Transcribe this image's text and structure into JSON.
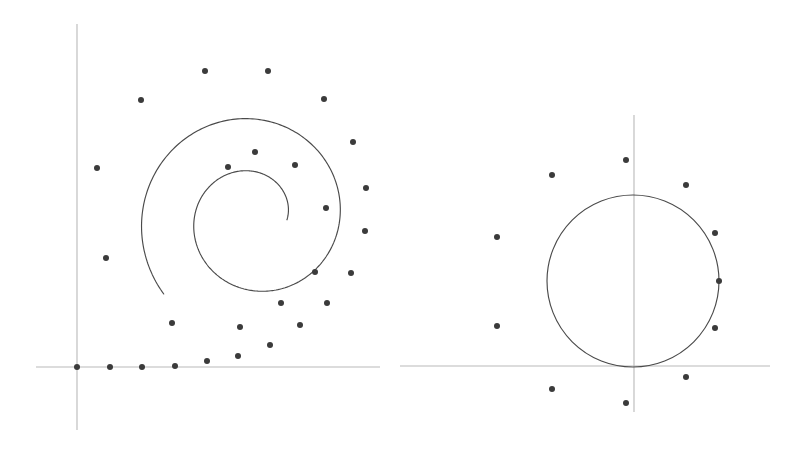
{
  "figure": {
    "background_color": "#ffffff",
    "width": 796,
    "height": 451,
    "axis_color": "#b9b9b9",
    "curve_color": "#4a4a4a",
    "dot_color": "#3b3b3b",
    "dot_radius": 3.0
  },
  "panels": [
    {
      "name": "left-panel-spiral",
      "label": "Spiral panel",
      "origin": {
        "x": 77,
        "y": 367
      },
      "axes": {
        "x_axis": {
          "x1": 36,
          "y1": 367,
          "x2": 380,
          "y2": 367
        },
        "y_axis": {
          "x1": 77,
          "y1": 24,
          "x2": 77,
          "y2": 430
        }
      },
      "curve": {
        "type": "spiral",
        "description": "Spiral curve starting at origin and winding counterclockwise inward to a center point",
        "inner_end": {
          "x": 228,
          "y": 167
        },
        "outer_end": {
          "x": 77,
          "y": 367
        },
        "turns": 1.62,
        "outer_radius": 118,
        "inner_radius": 33,
        "center": {
          "x": 254,
          "y": 218
        }
      },
      "points": [
        {
          "x": 77,
          "y": 367
        },
        {
          "x": 110,
          "y": 367
        },
        {
          "x": 142,
          "y": 367
        },
        {
          "x": 175,
          "y": 366
        },
        {
          "x": 207,
          "y": 361
        },
        {
          "x": 238,
          "y": 356
        },
        {
          "x": 270,
          "y": 345
        },
        {
          "x": 300,
          "y": 325
        },
        {
          "x": 327,
          "y": 303
        },
        {
          "x": 351,
          "y": 273
        },
        {
          "x": 365,
          "y": 231
        },
        {
          "x": 366,
          "y": 188
        },
        {
          "x": 353,
          "y": 142
        },
        {
          "x": 324,
          "y": 99
        },
        {
          "x": 268,
          "y": 71
        },
        {
          "x": 205,
          "y": 71
        },
        {
          "x": 141,
          "y": 100
        },
        {
          "x": 97,
          "y": 168
        },
        {
          "x": 106,
          "y": 258
        },
        {
          "x": 172,
          "y": 323
        },
        {
          "x": 240,
          "y": 327
        },
        {
          "x": 281,
          "y": 303
        },
        {
          "x": 315,
          "y": 272
        },
        {
          "x": 326,
          "y": 208
        },
        {
          "x": 295,
          "y": 165
        },
        {
          "x": 255,
          "y": 152
        },
        {
          "x": 228,
          "y": 167
        }
      ]
    },
    {
      "name": "right-panel-circle",
      "label": "Circle panel",
      "origin": {
        "x": 634,
        "y": 366
      },
      "axes": {
        "x_axis": {
          "x1": 400,
          "y1": 366,
          "x2": 770,
          "y2": 366
        },
        "y_axis": {
          "x1": 634,
          "y1": 115,
          "x2": 634,
          "y2": 412
        }
      },
      "curve": {
        "type": "circle",
        "description": "Circle tangent to the x-axis at the origin, centered above it",
        "center": {
          "x": 633,
          "y": 281
        },
        "radius": 86
      },
      "points": [
        {
          "x": 626,
          "y": 160
        },
        {
          "x": 552,
          "y": 175
        },
        {
          "x": 686,
          "y": 185
        },
        {
          "x": 497,
          "y": 237
        },
        {
          "x": 715,
          "y": 233
        },
        {
          "x": 719,
          "y": 281
        },
        {
          "x": 497,
          "y": 326
        },
        {
          "x": 715,
          "y": 328
        },
        {
          "x": 686,
          "y": 377
        },
        {
          "x": 552,
          "y": 389
        },
        {
          "x": 626,
          "y": 403
        }
      ]
    }
  ],
  "chart_data": {
    "type": "scatter",
    "subtitle": "",
    "xlabel": "",
    "ylabel": "",
    "grid": false,
    "legend": "none",
    "xlim": [
      0,
      796
    ],
    "ylim": [
      0,
      451
    ],
    "series": [
      {
        "name": "spiral-points",
        "marker": "filled-circle",
        "color": "#3b3b3b",
        "x": [
          77,
          110,
          142,
          175,
          207,
          238,
          270,
          300,
          327,
          351,
          365,
          366,
          353,
          324,
          268,
          205,
          141,
          97,
          106,
          172,
          240,
          281,
          315,
          326,
          295,
          255,
          228
        ],
        "y": [
          367,
          367,
          367,
          366,
          361,
          356,
          345,
          325,
          303,
          273,
          231,
          188,
          142,
          99,
          71,
          71,
          100,
          168,
          258,
          323,
          327,
          303,
          272,
          208,
          165,
          152,
          167
        ]
      },
      {
        "name": "circle-points",
        "marker": "filled-circle",
        "color": "#3b3b3b",
        "x": [
          626,
          552,
          686,
          497,
          715,
          719,
          497,
          715,
          686,
          552,
          626
        ],
        "y": [
          160,
          175,
          185,
          237,
          233,
          281,
          326,
          328,
          377,
          389,
          403
        ]
      }
    ],
    "curves": [
      {
        "name": "spiral-curve",
        "type": "spiral",
        "color": "#4a4a4a",
        "turns": 1.62,
        "start_radius": 118,
        "end_radius": 33
      },
      {
        "name": "circle-curve",
        "type": "circle",
        "color": "#4a4a4a",
        "center_x": 633,
        "center_y": 281,
        "radius": 86
      }
    ]
  }
}
